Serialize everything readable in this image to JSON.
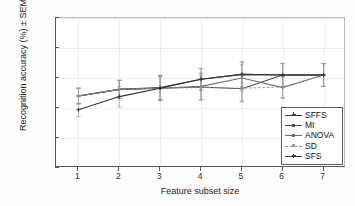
{
  "chart_data": {
    "type": "line",
    "title": "",
    "xlabel": "Feature subset size",
    "ylabel": "Recognition accuracy (%) ± SEM",
    "x": [
      1,
      2,
      3,
      4,
      5,
      6,
      7
    ],
    "xlim": [
      0.45,
      7.55
    ],
    "ylim": [
      0,
      0.25
    ],
    "xticks": [
      "1",
      "2",
      "3",
      "4",
      "5",
      "6",
      "7"
    ],
    "yticks": [
      "0",
      "0.05",
      "0.1",
      "0.15",
      "0.2",
      "0.25"
    ],
    "ytick_values": [
      0,
      0.05,
      0.1,
      0.15,
      0.2,
      0.25
    ],
    "grid": true,
    "legend_position": "lower right",
    "errorbars": "SEM",
    "series": [
      {
        "name": "SFFS",
        "color": "#3a3a3a",
        "style": "solid",
        "marker": "plus",
        "values": [
          0.12,
          0.131,
          0.134,
          0.148,
          0.156,
          0.155,
          0.155
        ],
        "error": [
          0.013,
          0.015,
          0.021,
          0.018,
          0.021,
          0.019,
          0.019
        ]
      },
      {
        "name": "MI",
        "color": "#4a4a4a",
        "style": "solid",
        "marker": "dot",
        "values": [
          0.12,
          0.131,
          0.133,
          0.135,
          0.132,
          0.155,
          0.155
        ],
        "error": [
          0.013,
          0.015,
          0.02,
          0.022,
          0.022,
          0.019,
          0.019
        ]
      },
      {
        "name": "ANOVA",
        "color": "#6e6e6e",
        "style": "solid",
        "marker": "dot",
        "values": [
          0.12,
          0.131,
          0.133,
          0.136,
          0.15,
          0.134,
          0.155
        ],
        "error": [
          0.013,
          0.015,
          0.02,
          0.022,
          0.022,
          0.018,
          0.019
        ]
      },
      {
        "name": "SD",
        "color": "#8e8e8e",
        "style": "dashed",
        "marker": "dot",
        "values": [
          0.12,
          0.131,
          0.133,
          0.134,
          0.133,
          0.135,
          0.155
        ],
        "error": [
          0.013,
          0.015,
          0.019,
          0.02,
          0.021,
          0.018,
          0.019
        ]
      },
      {
        "name": "SFS",
        "color": "#333333",
        "style": "solid",
        "marker": "plus",
        "values": [
          0.097,
          0.119,
          0.133,
          0.148,
          0.156,
          0.155,
          0.155
        ],
        "error": [
          0.011,
          0.017,
          0.021,
          0.018,
          0.021,
          0.019,
          0.019
        ]
      }
    ]
  },
  "legend": {
    "items": [
      {
        "label": "SFFS"
      },
      {
        "label": "MI"
      },
      {
        "label": "ANOVA"
      },
      {
        "label": "SD"
      },
      {
        "label": "SFS"
      }
    ]
  }
}
